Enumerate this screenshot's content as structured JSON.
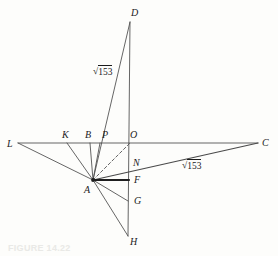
{
  "figure": {
    "caption": "FIGURE 14.22",
    "stroke_color": "#4a4a4a",
    "emphasis_color": "#1f1f1f",
    "background": "#fdfdfb",
    "points": [
      {
        "id": "D",
        "label": "D",
        "x": 130,
        "y": 22,
        "lx": 131,
        "ly": 8,
        "anchor": "start"
      },
      {
        "id": "L",
        "label": "L",
        "x": 18,
        "y": 143,
        "lx": 7,
        "ly": 139,
        "anchor": "start"
      },
      {
        "id": "K",
        "label": "K",
        "x": 67,
        "y": 143,
        "lx": 62,
        "ly": 130,
        "anchor": "start"
      },
      {
        "id": "B",
        "label": "B",
        "x": 90,
        "y": 143,
        "lx": 85,
        "ly": 130,
        "anchor": "start"
      },
      {
        "id": "P",
        "label": "P",
        "x": 100,
        "y": 143,
        "lx": 102,
        "ly": 130,
        "anchor": "start"
      },
      {
        "id": "O",
        "label": "O",
        "x": 130,
        "y": 143,
        "lx": 130,
        "ly": 130,
        "anchor": "start"
      },
      {
        "id": "C",
        "label": "C",
        "x": 258,
        "y": 143,
        "lx": 262,
        "ly": 138,
        "anchor": "start"
      },
      {
        "id": "N",
        "label": "N",
        "x": 129,
        "y": 168,
        "lx": 133,
        "ly": 158,
        "anchor": "start"
      },
      {
        "id": "A",
        "label": "A",
        "x": 93,
        "y": 180,
        "lx": 84,
        "ly": 185,
        "anchor": "start"
      },
      {
        "id": "F",
        "label": "F",
        "x": 129,
        "y": 180,
        "lx": 134,
        "ly": 175,
        "anchor": "start"
      },
      {
        "id": "G",
        "label": "G",
        "x": 128,
        "y": 201,
        "lx": 134,
        "ly": 196,
        "anchor": "start"
      },
      {
        "id": "H",
        "label": "H",
        "x": 128,
        "y": 236,
        "lx": 130,
        "ly": 237,
        "anchor": "start"
      }
    ],
    "segments": [
      {
        "name": "line-L-C",
        "from": "L",
        "to": "C",
        "style": "solid",
        "weight": "thin"
      },
      {
        "name": "line-D-H",
        "from": "D",
        "to": "H",
        "style": "solid",
        "weight": "thin"
      },
      {
        "name": "ray-A-L",
        "from": "A",
        "to": "L",
        "style": "solid",
        "weight": "thin"
      },
      {
        "name": "ray-A-K",
        "from": "A",
        "to": "K",
        "style": "solid",
        "weight": "thin"
      },
      {
        "name": "ray-A-B",
        "from": "A",
        "to": "B",
        "style": "solid",
        "weight": "thin"
      },
      {
        "name": "ray-A-P",
        "from": "A",
        "to": "P",
        "style": "solid",
        "weight": "thin"
      },
      {
        "name": "ray-A-D",
        "from": "A",
        "to": "D",
        "style": "solid",
        "weight": "thin"
      },
      {
        "name": "ray-A-O",
        "from": "A",
        "to": "O",
        "style": "dashed",
        "weight": "thin"
      },
      {
        "name": "ray-A-C",
        "from": "A",
        "to": "C",
        "style": "solid",
        "weight": "medium"
      },
      {
        "name": "ray-A-F",
        "from": "A",
        "to": "F",
        "style": "solid",
        "weight": "thick"
      },
      {
        "name": "ray-A-G",
        "from": "A",
        "to": "G",
        "style": "solid",
        "weight": "thin"
      },
      {
        "name": "ray-A-H",
        "from": "A",
        "to": "H",
        "style": "solid",
        "weight": "thin"
      }
    ],
    "measurements": [
      {
        "name": "length-AD",
        "value": "153",
        "prefix": "√",
        "x": 93,
        "y": 67,
        "for": "ray-A-D"
      },
      {
        "name": "length-AC",
        "value": "153",
        "prefix": "√",
        "x": 182,
        "y": 161,
        "for": "ray-A-C"
      }
    ]
  }
}
